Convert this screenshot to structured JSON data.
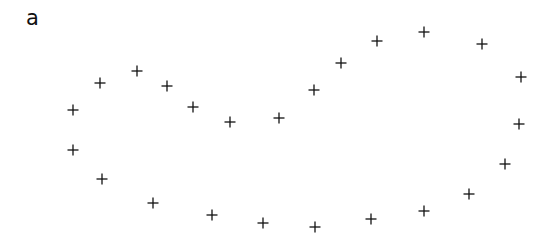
{
  "figure": {
    "label": "a",
    "marker": "plus",
    "marker_color": "#111111"
  },
  "chart_data": {
    "type": "scatter",
    "title": "",
    "subfigure_label": "a",
    "xlabel": "",
    "ylabel": "",
    "grid": false,
    "points": [
      {
        "x": 73,
        "y": 110
      },
      {
        "x": 100,
        "y": 83
      },
      {
        "x": 137,
        "y": 71
      },
      {
        "x": 167,
        "y": 86
      },
      {
        "x": 193,
        "y": 107
      },
      {
        "x": 230,
        "y": 122
      },
      {
        "x": 279,
        "y": 118
      },
      {
        "x": 314,
        "y": 90
      },
      {
        "x": 341,
        "y": 63
      },
      {
        "x": 377,
        "y": 41
      },
      {
        "x": 424,
        "y": 32
      },
      {
        "x": 482,
        "y": 44
      },
      {
        "x": 521,
        "y": 77
      },
      {
        "x": 519,
        "y": 124
      },
      {
        "x": 505,
        "y": 164
      },
      {
        "x": 469,
        "y": 194
      },
      {
        "x": 424,
        "y": 211
      },
      {
        "x": 371,
        "y": 219
      },
      {
        "x": 315,
        "y": 227
      },
      {
        "x": 263,
        "y": 223
      },
      {
        "x": 212,
        "y": 215
      },
      {
        "x": 153,
        "y": 203
      },
      {
        "x": 102,
        "y": 179
      },
      {
        "x": 73,
        "y": 150
      }
    ]
  }
}
